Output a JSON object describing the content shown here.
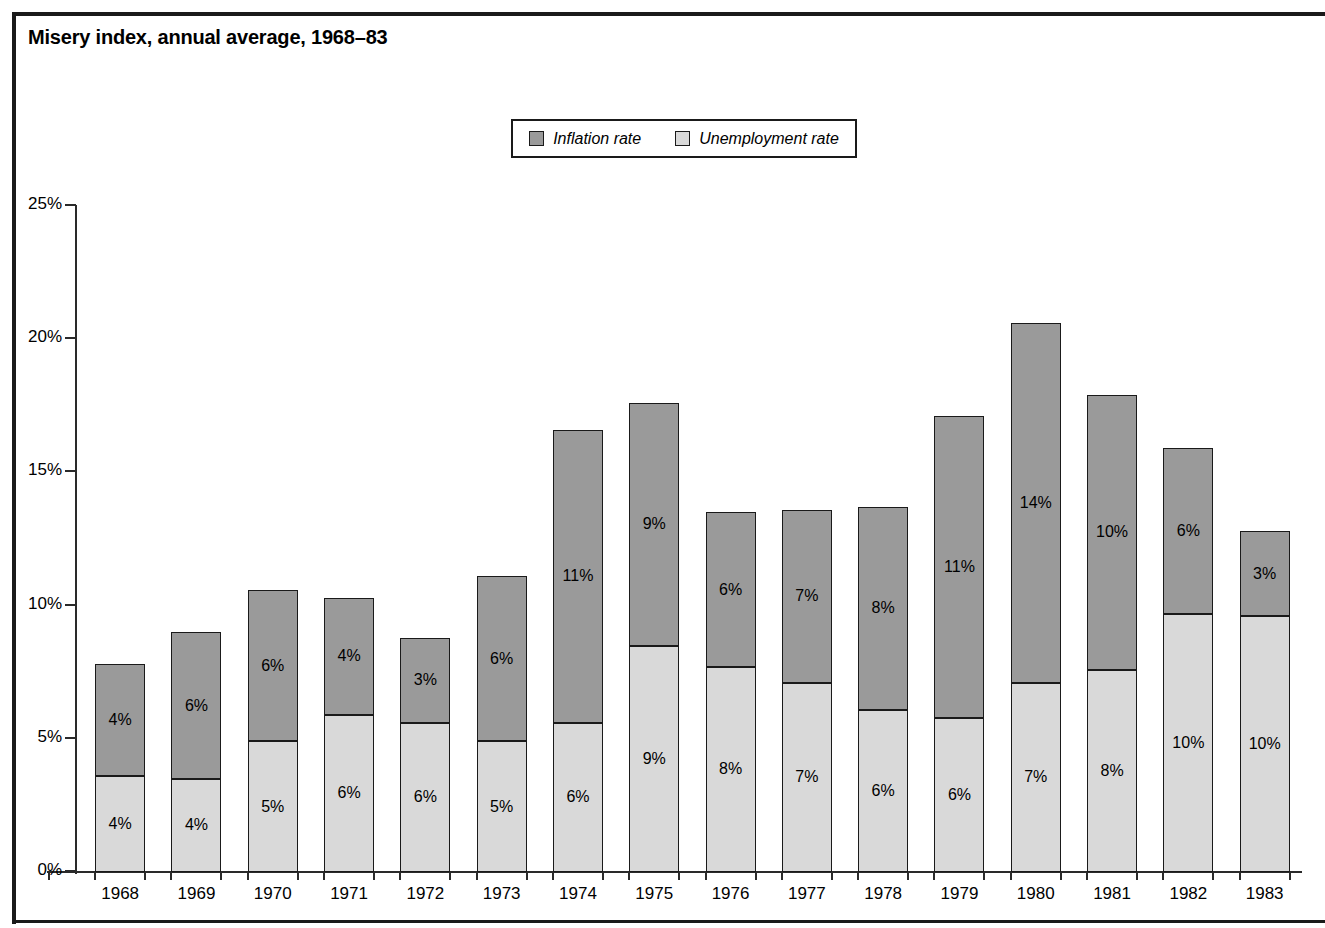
{
  "title": "Misery index, annual average, 1968–83",
  "colors": {
    "inflation": "#9a9a9a",
    "unemployment": "#d9d9d9",
    "outline": "#1a1a1a",
    "axis": "#2a2a2a",
    "background": "#ffffff"
  },
  "legend": {
    "entries": [
      {
        "label": "Inflation rate",
        "swatch": "#9a9a9a"
      },
      {
        "label": "Unemployment rate",
        "swatch": "#d9d9d9"
      }
    ]
  },
  "axis": {
    "y_ticks": [
      "0%",
      "5%",
      "10%",
      "15%",
      "20%",
      "25%"
    ],
    "y_tick_values": [
      0,
      5,
      10,
      15,
      20,
      25
    ]
  },
  "chart_data": {
    "type": "bar",
    "subtype": "stacked-vertical",
    "title": "Misery index, annual average, 1968–83",
    "xlabel": "",
    "ylabel": "",
    "ylim": [
      0,
      25
    ],
    "grid": false,
    "legend_position": "top-center",
    "categories": [
      "1968",
      "1969",
      "1970",
      "1971",
      "1972",
      "1973",
      "1974",
      "1975",
      "1976",
      "1977",
      "1978",
      "1979",
      "1980",
      "1981",
      "1982",
      "1983"
    ],
    "series": [
      {
        "name": "Unemployment rate",
        "color": "#d9d9d9",
        "values": [
          3.6,
          3.5,
          4.9,
          5.9,
          5.6,
          4.9,
          5.6,
          8.5,
          7.7,
          7.1,
          6.1,
          5.8,
          7.1,
          7.6,
          9.7,
          9.6
        ],
        "labels": [
          "4%",
          "4%",
          "5%",
          "6%",
          "6%",
          "5%",
          "6%",
          "9%",
          "8%",
          "7%",
          "6%",
          "6%",
          "7%",
          "8%",
          "10%",
          "10%"
        ]
      },
      {
        "name": "Inflation rate",
        "color": "#9a9a9a",
        "values": [
          4.2,
          5.5,
          5.7,
          4.4,
          3.2,
          6.2,
          11.0,
          9.1,
          5.8,
          6.5,
          7.6,
          11.3,
          13.5,
          10.3,
          6.2,
          3.2
        ],
        "labels": [
          "4%",
          "6%",
          "6%",
          "4%",
          "3%",
          "6%",
          "11%",
          "9%",
          "6%",
          "7%",
          "8%",
          "11%",
          "14%",
          "10%",
          "6%",
          "3%"
        ]
      }
    ],
    "totals": [
      7.8,
      9.0,
      10.6,
      10.3,
      8.8,
      11.1,
      16.6,
      17.6,
      13.5,
      13.6,
      13.7,
      17.1,
      20.6,
      17.9,
      15.9,
      12.8
    ]
  }
}
